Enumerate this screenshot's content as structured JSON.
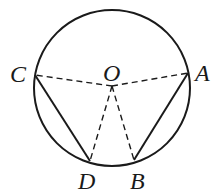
{
  "diagram": {
    "type": "circle-geometry",
    "circle": {
      "center": "O",
      "cx": 112,
      "cy": 88,
      "r": 78
    },
    "points": {
      "O": {
        "label": "O",
        "x": 112,
        "y": 86
      },
      "A": {
        "label": "A",
        "x": 188,
        "y": 73
      },
      "B": {
        "label": "B",
        "x": 134,
        "y": 160
      },
      "C": {
        "label": "C",
        "x": 35,
        "y": 75
      },
      "D": {
        "label": "D",
        "x": 90,
        "y": 161
      }
    },
    "solid_segments": [
      [
        "C",
        "D"
      ],
      [
        "A",
        "B"
      ]
    ],
    "dashed_segments": [
      [
        "O",
        "C"
      ],
      [
        "O",
        "A"
      ],
      [
        "O",
        "D"
      ],
      [
        "O",
        "B"
      ]
    ],
    "colors": {
      "stroke": "#1a1a1a",
      "background": "#ffffff"
    }
  }
}
